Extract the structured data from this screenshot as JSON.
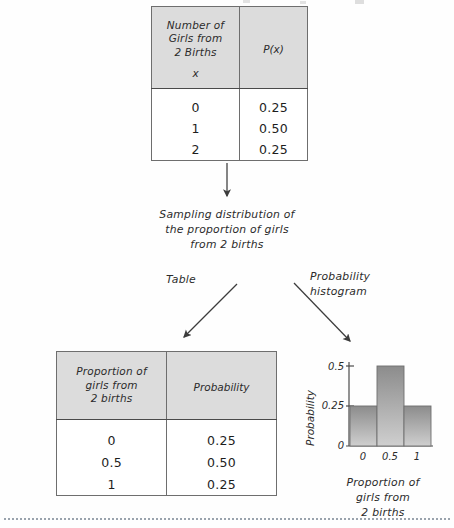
{
  "top_table": {
    "header": {
      "col1": "Number of\nGirls from\n2 Births",
      "col1_sub": "x",
      "col2": "P(x)"
    },
    "rows": [
      {
        "x": "0",
        "p": "0.25"
      },
      {
        "x": "1",
        "p": "0.50"
      },
      {
        "x": "2",
        "p": "0.25"
      }
    ]
  },
  "center_caption": "Sampling distribution of\nthe proportion of girls\nfrom 2 births",
  "branch_labels": {
    "left": "Table",
    "right": "Probability\nhistogram"
  },
  "bottom_table": {
    "header": {
      "col1": "Proportion of\ngirls from\n2 births",
      "col2": "Probability"
    },
    "rows": [
      {
        "proportion": "0",
        "probability": "0.25"
      },
      {
        "proportion": "0.5",
        "probability": "0.50"
      },
      {
        "proportion": "1",
        "probability": "0.25"
      }
    ]
  },
  "chart_data": {
    "type": "bar",
    "title": "",
    "categories": [
      "0",
      "0.5",
      "1"
    ],
    "values": [
      0.25,
      0.5,
      0.25
    ],
    "xlabel": "Proportion of\ngirls from\n2 births",
    "ylabel": "Probability",
    "ytick_labels": [
      "0",
      "0.25",
      "0.5"
    ],
    "ytick_values": [
      0,
      0.25,
      0.5
    ],
    "ylim": [
      0,
      0.5
    ],
    "grid": false,
    "legend": false,
    "bar_fill_top": "#8c8c8c",
    "bar_fill_bottom": "#c9c9c9",
    "axis_color": "#4a4a4a"
  },
  "colors": {
    "page_background": "#fefefe",
    "table_header_fill": "#dcdcdc",
    "table_border": "#6e6e6e",
    "text": "#231f20",
    "arrow": "#3c3c3c",
    "rule": "#9aa3ad"
  }
}
